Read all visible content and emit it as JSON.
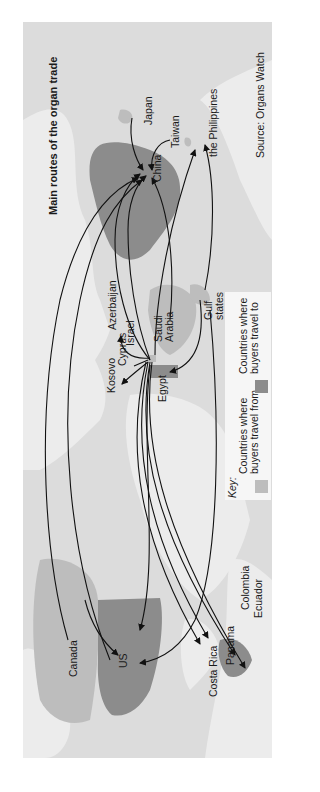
{
  "title": "Main routes of the organ trade",
  "source": "Source: Organs Watch",
  "colors": {
    "background": "#ffffff",
    "ocean": "#dcdcdc",
    "land_neutral": "#ebebeb",
    "from_countries": "#bdbdbd",
    "to_countries": "#8c8c8c",
    "route_line": "#111111"
  },
  "labels": {
    "japan": "Japan",
    "taiwan": "Taiwan",
    "china": "China",
    "philippines": "the Philippines",
    "azerbaijan": "Azerbaijan",
    "israel": "Israel",
    "kosovo": "Kosovo",
    "cyprus": "Cyprus",
    "saudi_arabia": "Saudi\nArabia",
    "gulf_states": "Gulf\nstates",
    "egypt": "Egypt",
    "colombia": "Colombia",
    "ecuador": "Ecuador",
    "panama": "Panama",
    "costa_rica": "Costa Rica",
    "canada": "Canada",
    "us": "US"
  },
  "legend": {
    "heading": "Key:",
    "items": [
      {
        "label": "Countries where\nbuyers travel from",
        "color": "#bdbdbd"
      },
      {
        "label": "Countries where\nbuyers travel to",
        "color": "#8c8c8c"
      }
    ]
  },
  "routes": [
    {
      "from": "Japan",
      "to": "China"
    },
    {
      "from": "Taiwan",
      "to": "China"
    },
    {
      "from": "Israel",
      "to": "China"
    },
    {
      "from": "Saudi Arabia",
      "to": "China"
    },
    {
      "from": "Canada",
      "to": "China"
    },
    {
      "from": "US",
      "to": "China"
    },
    {
      "from": "Gulf states",
      "to": "the Philippines"
    },
    {
      "from": "Israel",
      "to": "the Philippines"
    },
    {
      "from": "Israel",
      "to": "Azerbaijan"
    },
    {
      "from": "Israel",
      "to": "Kosovo"
    },
    {
      "from": "Israel",
      "to": "Cyprus"
    },
    {
      "from": "Gulf states",
      "to": "Egypt"
    },
    {
      "from": "Israel",
      "to": "US"
    },
    {
      "from": "Israel",
      "to": "Colombia"
    },
    {
      "from": "Israel",
      "to": "Ecuador"
    },
    {
      "from": "Israel",
      "to": "Panama"
    },
    {
      "from": "Israel",
      "to": "Costa Rica"
    },
    {
      "from": "Gulf states",
      "to": "US"
    },
    {
      "from": "Canada",
      "to": "US"
    }
  ]
}
